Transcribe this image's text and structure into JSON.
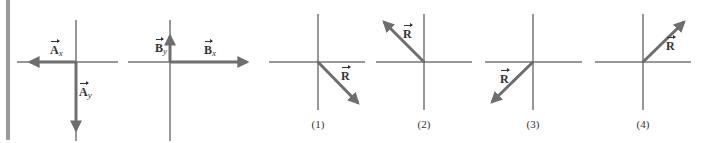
{
  "figure": {
    "diagrams": [
      {
        "id": "A",
        "caption": "",
        "components": [
          {
            "name": "A",
            "subscript": "x",
            "direction": "left"
          },
          {
            "name": "A",
            "subscript": "y",
            "direction": "down"
          }
        ]
      },
      {
        "id": "B",
        "caption": "",
        "components": [
          {
            "name": "B",
            "subscript": "y",
            "direction": "up"
          },
          {
            "name": "B",
            "subscript": "x",
            "direction": "right"
          }
        ]
      },
      {
        "id": "1",
        "caption": "(1)",
        "vector": {
          "name": "R",
          "direction": "down-right"
        }
      },
      {
        "id": "2",
        "caption": "(2)",
        "vector": {
          "name": "R",
          "direction": "up-left"
        }
      },
      {
        "id": "3",
        "caption": "(3)",
        "vector": {
          "name": "R",
          "direction": "down-left"
        }
      },
      {
        "id": "4",
        "caption": "(4)",
        "vector": {
          "name": "R",
          "direction": "up-right"
        }
      }
    ],
    "labels": {
      "ax_name": "A",
      "ax_sub": "x",
      "ay_name": "A",
      "ay_sub": "y",
      "by_name": "B",
      "by_sub": "y",
      "bx_name": "B",
      "bx_sub": "x",
      "r1": "R",
      "r2": "R",
      "r3": "R",
      "r4": "R"
    },
    "captions": [
      "(1)",
      "(2)",
      "(3)",
      "(4)"
    ],
    "colors": {
      "axis": "#333333",
      "vector": "#6e6e6e",
      "side_bar": "#9a9a9a"
    }
  }
}
